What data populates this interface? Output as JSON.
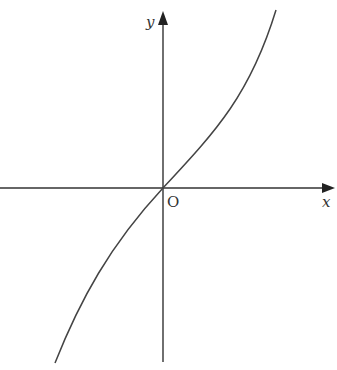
{
  "diagram": {
    "type": "function-graph",
    "axes": {
      "x_label": "x",
      "y_label": "y",
      "origin_label": "O"
    },
    "colors": {
      "axis": "#333333",
      "curve": "#444444",
      "background": "#ffffff"
    }
  }
}
